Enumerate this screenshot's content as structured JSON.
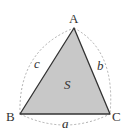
{
  "diagram": {
    "vertices": {
      "A": {
        "label": "A",
        "x": 74,
        "y": 28
      },
      "B": {
        "label": "B",
        "x": 20,
        "y": 114
      },
      "C": {
        "label": "C",
        "x": 110,
        "y": 114
      }
    },
    "sides": {
      "a": {
        "label": "a",
        "between": [
          "B",
          "C"
        ]
      },
      "b": {
        "label": "b",
        "between": [
          "A",
          "C"
        ]
      },
      "c": {
        "label": "c",
        "between": [
          "A",
          "B"
        ]
      }
    },
    "area": {
      "label": "S"
    },
    "colors": {
      "fill": "#c8c8c8",
      "stroke": "#333333",
      "dashed_arc": "#999999",
      "text": "#333333"
    }
  }
}
